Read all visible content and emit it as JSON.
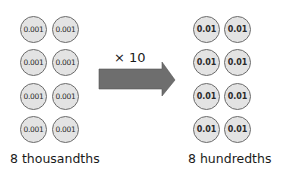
{
  "left_group": {
    "coin_value": "0.001",
    "count": 8,
    "label": "8 thousandths",
    "coins": [
      "0.001",
      "0.001",
      "0.001",
      "0.001",
      "0.001",
      "0.001",
      "0.001",
      "0.001"
    ]
  },
  "operation": {
    "label": "× 10",
    "arrow_color": "#6e6e6e"
  },
  "right_group": {
    "coin_value": "0.01",
    "count": 8,
    "label": "8 hundredths",
    "coins": [
      "0.01",
      "0.01",
      "0.01",
      "0.01",
      "0.01",
      "0.01",
      "0.01",
      "0.01"
    ]
  },
  "colors": {
    "coin_fill": "#e3e3e3",
    "coin_border": "#6b6b6b",
    "text": "#1a1a1a"
  }
}
